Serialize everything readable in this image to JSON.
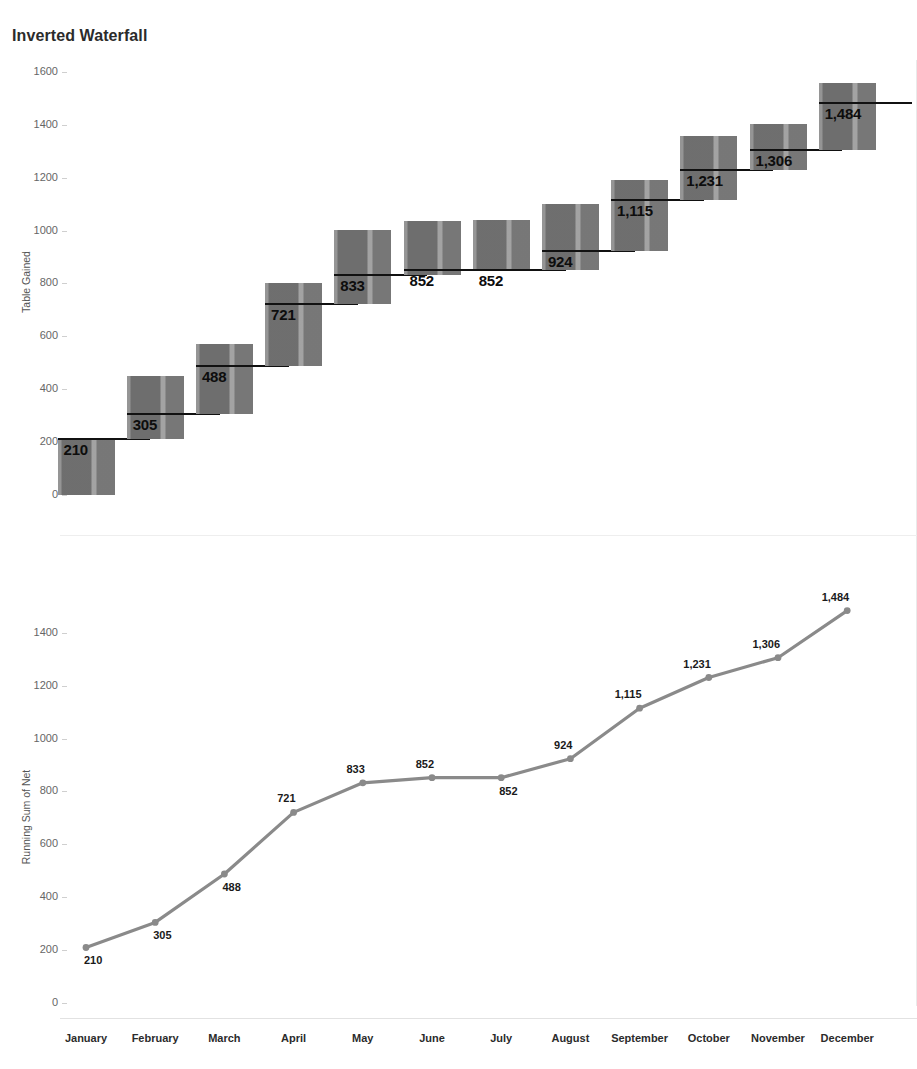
{
  "title": "Inverted Waterfall",
  "colors": {
    "bar": "#7b7b7b",
    "reference_line": "#111111",
    "line_series": "#8a8a8a",
    "marker": "#8a8a8a",
    "axis_text": "#666666",
    "title_text": "#2b2b2b",
    "grid": "#e2e2e2"
  },
  "chart_data": [
    {
      "type": "bar",
      "chart_name": "inverted-waterfall-bars",
      "title": "Inverted Waterfall",
      "xlabel": "",
      "ylabel": "Table Gained",
      "ylim": [
        0,
        1600
      ],
      "yticks": [
        0,
        200,
        400,
        600,
        800,
        1000,
        1200,
        1400,
        1600
      ],
      "ytick_labels": [
        "0",
        "200",
        "400",
        "600",
        "800",
        "1000",
        "1200",
        "1400",
        "1600"
      ],
      "grid": false,
      "legend": "none",
      "categories": [
        "January",
        "February",
        "March",
        "April",
        "May",
        "June",
        "July",
        "August",
        "September",
        "October",
        "November",
        "December"
      ],
      "values": [
        210,
        95,
        183,
        233,
        112,
        19,
        0,
        72,
        191,
        116,
        75,
        178
      ],
      "cumulative": [
        210,
        305,
        488,
        721,
        833,
        852,
        852,
        924,
        1115,
        1231,
        1306,
        1484
      ],
      "bar_bottoms": [
        0,
        210,
        305,
        488,
        721,
        833,
        852,
        852,
        924,
        1115,
        1231,
        1306
      ],
      "bar_tops": [
        210,
        450,
        570,
        800,
        1003,
        1038,
        1040,
        1100,
        1190,
        1357,
        1404,
        1560
      ],
      "reference_lines": [
        210,
        305,
        488,
        721,
        833,
        852,
        852,
        924,
        1115,
        1231,
        1306,
        1484
      ],
      "data_labels": [
        "210",
        "305",
        "488",
        "721",
        "833",
        "852",
        "852",
        "924",
        "1,115",
        "1,231",
        "1,306",
        "1,484"
      ]
    },
    {
      "type": "line",
      "chart_name": "running-sum-line",
      "title": "",
      "xlabel": "",
      "ylabel": "Running Sum of Net",
      "ylim": [
        0,
        1500
      ],
      "yticks": [
        0,
        200,
        400,
        600,
        800,
        1000,
        1200,
        1400
      ],
      "ytick_labels": [
        "0",
        "200",
        "400",
        "600",
        "800",
        "1000",
        "1200",
        "1400"
      ],
      "grid": false,
      "legend": "none",
      "categories": [
        "January",
        "February",
        "March",
        "April",
        "May",
        "June",
        "July",
        "August",
        "September",
        "October",
        "November",
        "December"
      ],
      "values": [
        210,
        305,
        488,
        721,
        833,
        852,
        852,
        924,
        1115,
        1231,
        1306,
        1484
      ],
      "data_labels": [
        "210",
        "305",
        "488",
        "721",
        "833",
        "852",
        "852",
        "924",
        "1,115",
        "1,231",
        "1,306",
        "1,484"
      ],
      "label_positions": [
        "below",
        "below",
        "below",
        "above",
        "above",
        "above",
        "below",
        "above",
        "above",
        "above",
        "above",
        "above"
      ]
    }
  ],
  "axes": {
    "top": {
      "y_title": "Table Gained",
      "y_ticks": [
        "1600",
        "1400",
        "1200",
        "1000",
        "800",
        "600",
        "400",
        "200",
        "0"
      ]
    },
    "bottom": {
      "y_title": "Running Sum of Net",
      "y_ticks": [
        "1400",
        "1200",
        "1000",
        "800",
        "600",
        "400",
        "200",
        "0"
      ]
    },
    "x_categories": [
      "January",
      "February",
      "March",
      "April",
      "May",
      "June",
      "July",
      "August",
      "September",
      "October",
      "November",
      "December"
    ]
  }
}
